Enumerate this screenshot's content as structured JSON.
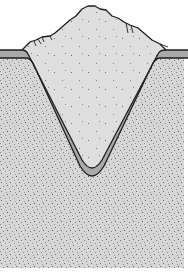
{
  "figure": {
    "title": "",
    "colors": {
      "background": "#ffffff",
      "native_soil": "#d6d6d6",
      "backfill": "#dedede",
      "liner": "#a9a9a9",
      "outline": "#1e1e1e",
      "speckle": "#6a6a6a"
    },
    "layers": [
      {
        "id": "native-soil",
        "label": ""
      },
      {
        "id": "liner",
        "label": ""
      },
      {
        "id": "backfill-mound",
        "label": ""
      }
    ]
  }
}
